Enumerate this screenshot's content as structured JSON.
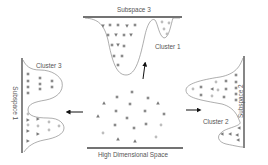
{
  "diagram": {
    "colors": {
      "axis": "#444444",
      "curve": "#777777",
      "square": "#8a8a8a",
      "triangle": "#7a7a7a",
      "circle": "#bdbdbd",
      "arrow": "#111111",
      "text": "#555555"
    },
    "labels": {
      "center": "High Dimensional Space",
      "top_axis": "Subspace 3",
      "left_axis": "Subspace 1",
      "right_axis": "Subspace 2",
      "top_cluster": "Cluster 1",
      "left_cluster": "Cluster 3",
      "right_cluster": "Cluster 2"
    },
    "panels": [
      {
        "name": "high-dimensional-space",
        "marker_types": [
          "square",
          "triangle",
          "circle"
        ]
      },
      {
        "name": "subspace-3",
        "clusters": [
          "square/triangle group",
          "Cluster 1 (circles)"
        ]
      },
      {
        "name": "subspace-1",
        "clusters": [
          "Cluster 3 (squares)",
          "triangle/circle group"
        ]
      },
      {
        "name": "subspace-2",
        "clusters": [
          "square/circle/triangle group",
          "Cluster 2 (triangles)"
        ]
      }
    ],
    "arrows": [
      {
        "from": "high-dimensional-space",
        "to": "subspace-3",
        "direction": "up"
      },
      {
        "from": "high-dimensional-space",
        "to": "subspace-1",
        "direction": "left"
      },
      {
        "from": "high-dimensional-space",
        "to": "subspace-2",
        "direction": "right"
      }
    ]
  }
}
